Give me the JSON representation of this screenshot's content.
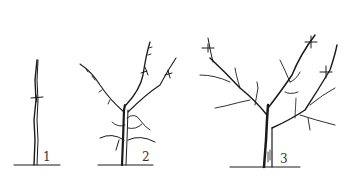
{
  "figure": {
    "line_color": "#1a1a1a",
    "background": "#ffffff",
    "stages": [
      {
        "label": "1",
        "name": "whip"
      },
      {
        "label": "2",
        "name": "young tree with scaffold branches"
      },
      {
        "label": "3",
        "name": "mature open-center tree"
      }
    ]
  }
}
